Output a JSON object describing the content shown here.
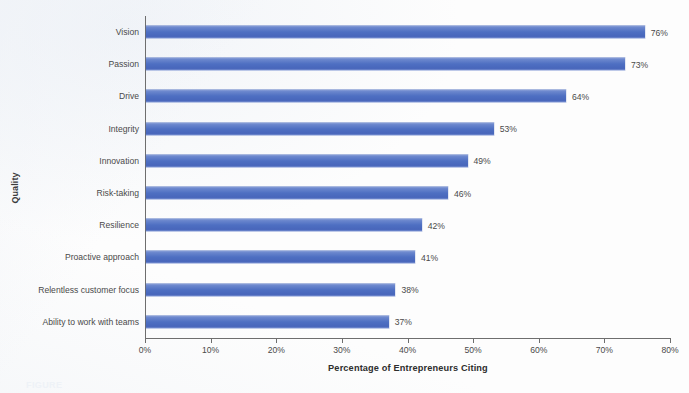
{
  "chart_data": {
    "type": "bar",
    "orientation": "horizontal",
    "title": "",
    "xlabel": "Percentage of Entrepreneurs Citing",
    "ylabel": "Quality",
    "xlim": [
      0,
      80
    ],
    "xticks": [
      "0%",
      "10%",
      "20%",
      "30%",
      "40%",
      "50%",
      "60%",
      "70%",
      "80%"
    ],
    "xtick_values": [
      0,
      10,
      20,
      30,
      40,
      50,
      60,
      70,
      80
    ],
    "grid": false,
    "legend": null,
    "bar_color": "#4e6fc2",
    "categories": [
      "Vision",
      "Passion",
      "Drive",
      "Integrity",
      "Innovation",
      "Risk-taking",
      "Resilience",
      "Proactive approach",
      "Relentless customer focus",
      "Ability to work with teams"
    ],
    "values": [
      76,
      73,
      64,
      53,
      49,
      46,
      42,
      41,
      38,
      37
    ],
    "data_labels": [
      "76%",
      "73%",
      "64%",
      "53%",
      "49%",
      "46%",
      "42%",
      "41%",
      "38%",
      "37%"
    ]
  },
  "caption": {
    "text": "FIGURE"
  }
}
